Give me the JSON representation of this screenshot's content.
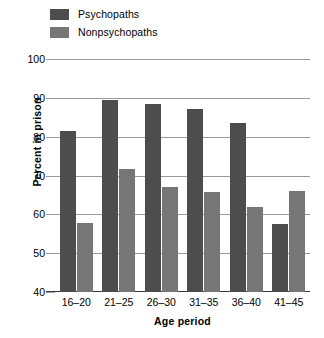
{
  "chart_data": {
    "type": "bar",
    "title": "",
    "xlabel": "Age period",
    "ylabel": "Percent in prison",
    "categories": [
      "16–20",
      "21–25",
      "26–30",
      "31–35",
      "36–40",
      "41–45"
    ],
    "series": [
      {
        "name": "Psychopaths",
        "color": "#4d4d4d",
        "values": [
          81.5,
          89.5,
          88.3,
          87.0,
          83.6,
          57.4
        ]
      },
      {
        "name": "Nonpsychopaths",
        "color": "#767676",
        "values": [
          57.8,
          71.6,
          67.0,
          65.7,
          61.9,
          65.9
        ]
      }
    ],
    "ylim": [
      40,
      100
    ],
    "yticks": [
      100,
      90,
      80,
      70,
      60,
      50,
      40
    ],
    "ytick_labels": [
      "100",
      "90",
      "80",
      "70",
      "60",
      "50",
      "40"
    ],
    "grid": true,
    "legend_position": "top-left"
  }
}
